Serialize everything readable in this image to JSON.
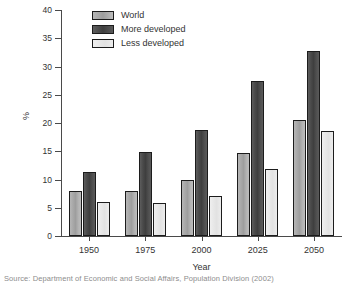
{
  "chart_data": {
    "type": "bar",
    "title": "",
    "xlabel": "Year",
    "ylabel": "%",
    "categories": [
      "1950",
      "1975",
      "2000",
      "2025",
      "2050"
    ],
    "series": [
      {
        "name": "World",
        "values": [
          8.0,
          8.0,
          10.0,
          14.7,
          20.5
        ]
      },
      {
        "name": "More developed",
        "values": [
          11.3,
          14.9,
          18.7,
          27.4,
          32.8
        ]
      },
      {
        "name": "Less developed",
        "values": [
          6.0,
          5.9,
          7.1,
          11.8,
          18.6
        ]
      }
    ],
    "ylim": [
      0,
      40
    ],
    "yticks": [
      0,
      5,
      10,
      15,
      20,
      25,
      30,
      35,
      40
    ],
    "ytick_labels": [
      "0",
      "5",
      "10",
      "15",
      "20",
      "25",
      "30",
      "35",
      "40"
    ],
    "grid": false,
    "legend_position": "top-left-inside",
    "colors": {
      "world": "#a9a9a9",
      "more_developed": "#4a4a4a",
      "less_developed": "#e8e8e8",
      "axis": "#4a4a4a",
      "text": "#333333",
      "background": "#ffffff"
    }
  },
  "legend": {
    "entries": [
      {
        "label": "World",
        "swatch": "world"
      },
      {
        "label": "More developed",
        "swatch": "more"
      },
      {
        "label": "Less developed",
        "swatch": "less"
      }
    ]
  },
  "caption": {
    "text": "Source: Department of Economic and Social Affairs, Population Division (2002)"
  }
}
